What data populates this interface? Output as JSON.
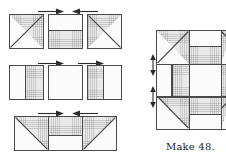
{
  "figure": {
    "kind": "quilt-block-assembly-diagram",
    "caption": "Make 48."
  },
  "colors": {
    "outline": "#4a4a4a",
    "light_fabric": "#fbfbfb",
    "shaded_fabric": "#e9e9e9",
    "arrow": "#2b2b2b",
    "background": "#ffffff"
  },
  "exploded_view": {
    "label": "exploded block layout",
    "rows": [
      {
        "name": "top-row",
        "units": [
          {
            "name": "top-left-unit",
            "type": "half-square-triangle",
            "diagonal": "bottom-left-to-top-right",
            "shaded_half": "upper-right"
          },
          {
            "name": "top-center-unit",
            "type": "two-bar-horizontal",
            "top_fabric": "light",
            "bottom_fabric": "shaded",
            "split_percent": 45
          },
          {
            "name": "top-right-unit",
            "type": "half-square-triangle",
            "diagonal": "top-left-to-bottom-right",
            "shaded_half": "upper-left"
          }
        ],
        "arrows": [
          {
            "name": "seam-arrow-right",
            "direction": "right"
          },
          {
            "name": "seam-arrow-left",
            "direction": "left"
          }
        ]
      },
      {
        "name": "middle-row",
        "units": [
          {
            "name": "middle-left-unit",
            "type": "two-bar-vertical",
            "left_fabric": "light",
            "right_fabric": "shaded",
            "split_percent": 45
          },
          {
            "name": "middle-center-unit",
            "type": "plain-square",
            "fabric": "light"
          },
          {
            "name": "middle-right-unit",
            "type": "two-bar-vertical",
            "left_fabric": "shaded",
            "right_fabric": "light",
            "split_percent": 45
          }
        ],
        "arrows": [
          {
            "name": "seam-arrow-right",
            "direction": "right"
          },
          {
            "name": "seam-arrow-right-2",
            "direction": "right"
          }
        ]
      },
      {
        "name": "bottom-row",
        "units": [
          {
            "name": "bottom-left-unit",
            "type": "half-square-triangle",
            "diagonal": "top-left-to-bottom-right",
            "shaded_half": "upper-right"
          },
          {
            "name": "bottom-center-unit",
            "type": "two-bar-horizontal",
            "top_fabric": "shaded",
            "bottom_fabric": "light",
            "split_percent": 55
          },
          {
            "name": "bottom-right-unit",
            "type": "half-square-triangle",
            "diagonal": "bottom-left-to-top-right",
            "shaded_half": "upper-left"
          }
        ],
        "arrows": [
          {
            "name": "seam-arrow-right",
            "direction": "right"
          },
          {
            "name": "seam-arrow-left",
            "direction": "left"
          }
        ]
      }
    ]
  },
  "finished_block": {
    "label": "assembled block",
    "cropped_at_right_edge": true,
    "row_seam_arrows": [
      {
        "name": "row-seam-arrow-top",
        "direction": "vertical-double"
      },
      {
        "name": "row-seam-arrow-bottom",
        "direction": "vertical-double"
      }
    ]
  }
}
